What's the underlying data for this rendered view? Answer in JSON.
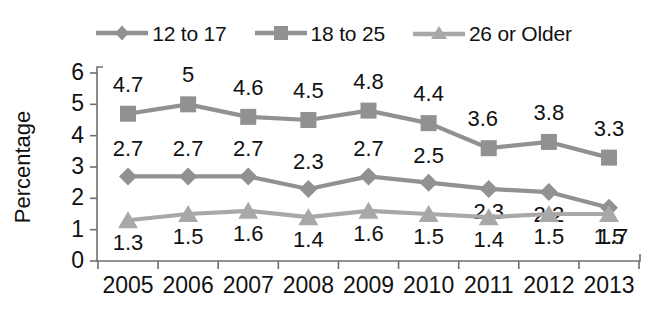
{
  "chart_data": {
    "type": "line",
    "title": "",
    "xlabel": "",
    "ylabel": "Percentage",
    "categories": [
      "2005",
      "2006",
      "2007",
      "2008",
      "2009",
      "2010",
      "2011",
      "2012",
      "2013"
    ],
    "ylim": [
      0,
      6
    ],
    "yticks": [
      "0",
      "1",
      "2",
      "3",
      "4",
      "5",
      "6"
    ],
    "grid": false,
    "legend_position": "top",
    "series": [
      {
        "name": "12 to 17",
        "marker": "diamond",
        "color": "#919191",
        "values": [
          2.7,
          2.7,
          2.7,
          2.3,
          2.7,
          2.5,
          2.3,
          2.2,
          1.7
        ],
        "labels": [
          "2.7",
          "2.7",
          "2.7",
          "2.3",
          "2.7",
          "2.5",
          "2.3",
          "2.2",
          "1.7"
        ]
      },
      {
        "name": "18 to 25",
        "marker": "square",
        "color": "#919191",
        "values": [
          4.7,
          5.0,
          4.6,
          4.5,
          4.8,
          4.4,
          3.6,
          3.8,
          3.3
        ],
        "labels": [
          "4.7",
          "5",
          "4.6",
          "4.5",
          "4.8",
          "4.4",
          "3.6",
          "3.8",
          "3.3"
        ]
      },
      {
        "name": "26 or Older",
        "marker": "triangle",
        "color": "#a8a8a8",
        "values": [
          1.3,
          1.5,
          1.6,
          1.4,
          1.6,
          1.5,
          1.4,
          1.5,
          1.5
        ],
        "labels": [
          "1.3",
          "1.5",
          "1.6",
          "1.4",
          "1.6",
          "1.5",
          "1.4",
          "1.5",
          "1.5"
        ]
      }
    ]
  },
  "legend": {
    "items": [
      {
        "label": "12 to 17",
        "marker": "diamond",
        "color": "#919191"
      },
      {
        "label": "18 to 25",
        "marker": "square",
        "color": "#919191"
      },
      {
        "label": "26 or Older",
        "marker": "triangle",
        "color": "#a8a8a8"
      }
    ]
  }
}
